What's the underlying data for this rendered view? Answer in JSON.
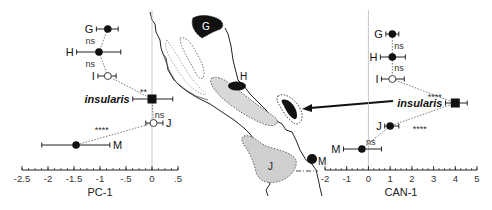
{
  "chart_data": [
    {
      "type": "scatter",
      "name": "pc1-panel",
      "xlabel": "PC-1",
      "xlim": [
        -2.5,
        0.5
      ],
      "xticks": [
        -2.5,
        -2,
        -1.5,
        -1,
        -0.5,
        0,
        0.5
      ],
      "xtick_labels": [
        "-2.5",
        "-2",
        "-1.5",
        "-1",
        "-.5",
        "0",
        ".5"
      ],
      "zero_line": 0,
      "points": [
        {
          "label": "G",
          "x": -0.85,
          "err": [
            -1.07,
            -0.65
          ],
          "marker": "filled-circle",
          "label_side": "left"
        },
        {
          "label": "H",
          "x": -1.02,
          "err": [
            -1.45,
            -0.6
          ],
          "marker": "filled-circle",
          "label_side": "left"
        },
        {
          "label": "I",
          "x": -0.85,
          "err": [
            -1.04,
            -0.69
          ],
          "marker": "open-circle",
          "label_side": "left"
        },
        {
          "label": "insularis",
          "x": 0.0,
          "err": [
            -0.37,
            0.4
          ],
          "marker": "filled-square",
          "label_side": "left"
        },
        {
          "label": "J",
          "x": 0.03,
          "err": [
            -0.12,
            0.21
          ],
          "marker": "open-circle",
          "label_side": "right"
        },
        {
          "label": "M",
          "x": -1.46,
          "err": [
            -2.12,
            -0.81
          ],
          "marker": "filled-circle",
          "label_side": "right"
        }
      ],
      "comparisons": [
        {
          "between": [
            "G",
            "H"
          ],
          "significance": "ns"
        },
        {
          "between": [
            "H",
            "I"
          ],
          "significance": "ns"
        },
        {
          "between": [
            "I",
            "insularis"
          ],
          "significance": "**"
        },
        {
          "between": [
            "insularis",
            "J"
          ],
          "significance": "ns"
        },
        {
          "between": [
            "J",
            "M"
          ],
          "significance": "****"
        }
      ]
    },
    {
      "type": "scatter",
      "name": "can1-panel",
      "xlabel": "CAN-1",
      "xlim": [
        -2,
        5
      ],
      "xticks": [
        -2,
        -1,
        0,
        1,
        2,
        3,
        4,
        5
      ],
      "xtick_labels": [
        "-2",
        "-1",
        "0",
        "1",
        "2",
        "3",
        "4",
        "5"
      ],
      "zero_line": 0,
      "points": [
        {
          "label": "G",
          "x": 1.1,
          "err": [
            0.8,
            1.4
          ],
          "marker": "filled-circle",
          "label_side": "left"
        },
        {
          "label": "H",
          "x": 1.1,
          "err": [
            0.55,
            1.7
          ],
          "marker": "filled-circle",
          "label_side": "left"
        },
        {
          "label": "I",
          "x": 1.1,
          "err": [
            0.6,
            1.65
          ],
          "marker": "open-circle",
          "label_side": "left"
        },
        {
          "label": "insularis",
          "x": 4.0,
          "err": [
            3.55,
            4.55
          ],
          "marker": "filled-square",
          "label_side": "left"
        },
        {
          "label": "J",
          "x": 1.0,
          "err": [
            0.75,
            1.4
          ],
          "marker": "filled-circle",
          "label_side": "left"
        },
        {
          "label": "M",
          "x": -0.3,
          "err": [
            -1.15,
            0.6
          ],
          "marker": "filled-circle",
          "label_side": "left"
        }
      ],
      "comparisons": [
        {
          "between": [
            "G",
            "H"
          ],
          "significance": "ns"
        },
        {
          "between": [
            "H",
            "I"
          ],
          "significance": "ns"
        },
        {
          "between": [
            "I",
            "insularis"
          ],
          "significance": "****"
        },
        {
          "between": [
            "insularis",
            "J"
          ],
          "significance": "****"
        },
        {
          "between": [
            "J",
            "M"
          ],
          "significance": "ns"
        }
      ]
    }
  ],
  "map": {
    "region_labels": {
      "G": "G",
      "H": "H",
      "J": "J",
      "M": "M"
    },
    "arrow_target": "insularis"
  }
}
